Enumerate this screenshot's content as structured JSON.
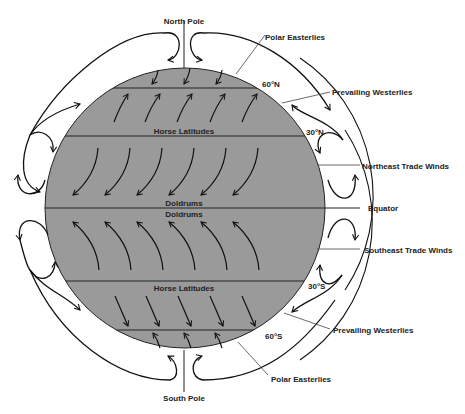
{
  "diagram": {
    "colors": {
      "globe_fill": "#9a9a9a",
      "line": "#111111",
      "background": "#ffffff"
    },
    "poles": {
      "north": "North Pole",
      "south": "South Pole"
    },
    "latitudes": {
      "n60": "60°N",
      "n30": "30°N",
      "s30": "30°S",
      "s60": "60°S"
    },
    "belt_labels": {
      "horse_latitudes_north": "Horse Latitudes",
      "doldrums_north": "Doldrums",
      "doldrums_south": "Doldrums",
      "horse_latitudes_south": "Horse Latitudes"
    },
    "callouts": {
      "polar_easterlies_north": "Polar Easterlies",
      "prevailing_westerlies_north": "Prevailing Westerlies",
      "northeast_trade_winds": "Northeast Trade Winds",
      "equator": "Equator",
      "southeast_trade_winds": "Southeast Trade Winds",
      "prevailing_westerlies_south": "Prevailing Westerlies",
      "polar_easterlies_south": "Polar Easterlies"
    },
    "wind_zones": [
      {
        "zone": "polar_north",
        "direction": "southwest",
        "arrows": 3
      },
      {
        "zone": "westerlies_north",
        "direction": "northeast",
        "arrows": 5
      },
      {
        "zone": "trades_north",
        "direction": "southwest",
        "arrows": 6
      },
      {
        "zone": "trades_south",
        "direction": "northwest",
        "arrows": 6
      },
      {
        "zone": "westerlies_south",
        "direction": "southeast",
        "arrows": 5
      },
      {
        "zone": "polar_south",
        "direction": "northwest",
        "arrows": 3
      }
    ]
  }
}
